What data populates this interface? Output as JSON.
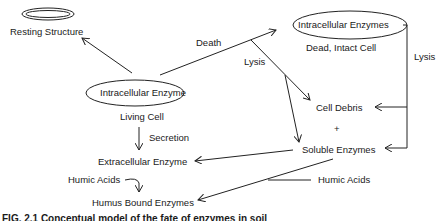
{
  "diagram": {
    "nodes": {
      "resting_structure": "Resting Structure",
      "intracellular_enzyme": "Intracellular Enzyme",
      "living_cell": "Living Cell",
      "intracellular_enzymes_dead": "Intracellular Enzymes",
      "dead_intact_cell": "Dead, Intact Cell",
      "cell_debris": "Cell Debris",
      "plus": "+",
      "soluble_enzymes": "Soluble Enzymes",
      "extracellular_enzyme": "Extracellular Enzyme",
      "humus_bound_enzymes": "Humus Bound Enzymes"
    },
    "edge_labels": {
      "death": "Death",
      "lysis_center": "Lysis",
      "lysis_right": "Lysis",
      "secretion": "Secretion",
      "humic_acids_left": "Humic Acids",
      "humic_acids_right": "Humic Acids"
    },
    "caption": "FIG. 2.1  Conceptual model of the fate of enzymes in soil"
  }
}
